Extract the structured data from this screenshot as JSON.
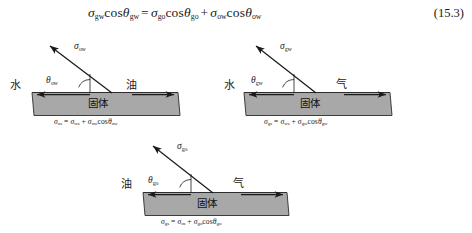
{
  "equation": {
    "number": "(15.3)",
    "lhs": {
      "sigma_sub": "gw",
      "theta_sub": "gw"
    },
    "rhs_term1": {
      "sigma_sub": "go",
      "theta_sub": "go"
    },
    "rhs_term2": {
      "sigma_sub": "ow",
      "theta_sub": "ow"
    },
    "equals": "=",
    "plus": "+",
    "cos": "cos",
    "sigma_glyph": "σ",
    "theta_glyph": "θ"
  },
  "diagrams": [
    {
      "id": "ow",
      "left_phase": "水",
      "right_phase": "油",
      "solid_label": "固体",
      "tension_sub": "ow",
      "angle_sub": "ow",
      "caption": {
        "lhs_sub": "os",
        "rhs1_sub": "ws",
        "rhs2_sigma_sub": "ow",
        "rhs2_theta_sub": "ow"
      }
    },
    {
      "id": "gw",
      "left_phase": "水",
      "right_phase": "气",
      "solid_label": "固体",
      "tension_sub": "gw",
      "angle_sub": "gw",
      "caption": {
        "lhs_sub": "gs",
        "rhs1_sub": "ws",
        "rhs2_sigma_sub": "gw",
        "rhs2_theta_sub": "gw"
      }
    },
    {
      "id": "go",
      "left_phase": "油",
      "right_phase": "气",
      "solid_label": "固体",
      "tension_sub": "go",
      "angle_sub": "go",
      "caption": {
        "lhs_sub": "gs",
        "rhs1_sub": "os",
        "rhs2_sigma_sub": "go",
        "rhs2_theta_sub": "go"
      }
    }
  ],
  "colors": {
    "bar_fill": "#a8a8a8",
    "bar_top_fill": "#bdbdbd",
    "bar_stroke": "#2b2b2b",
    "line": "#1a1a1a",
    "text": "#1a1a1a"
  }
}
